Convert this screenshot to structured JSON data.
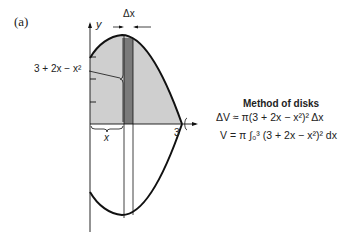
{
  "figure": {
    "panel_label": "(a)",
    "axis_y_label": "y",
    "delta_x_label": "Δx",
    "curve_label": "3 + 2x − x²",
    "x_brace_label": "x",
    "x_tick_label": "3"
  },
  "method": {
    "title": "Method of disks",
    "delta_v": "ΔV ≈ π(3 + 2x − x²)² Δx",
    "volume": "V = π ∫₀³ (3 + 2x − x²)² dx"
  },
  "colors": {
    "region_fill": "#cfcfcf",
    "strip_fill": "#777777",
    "line": "#111111"
  }
}
